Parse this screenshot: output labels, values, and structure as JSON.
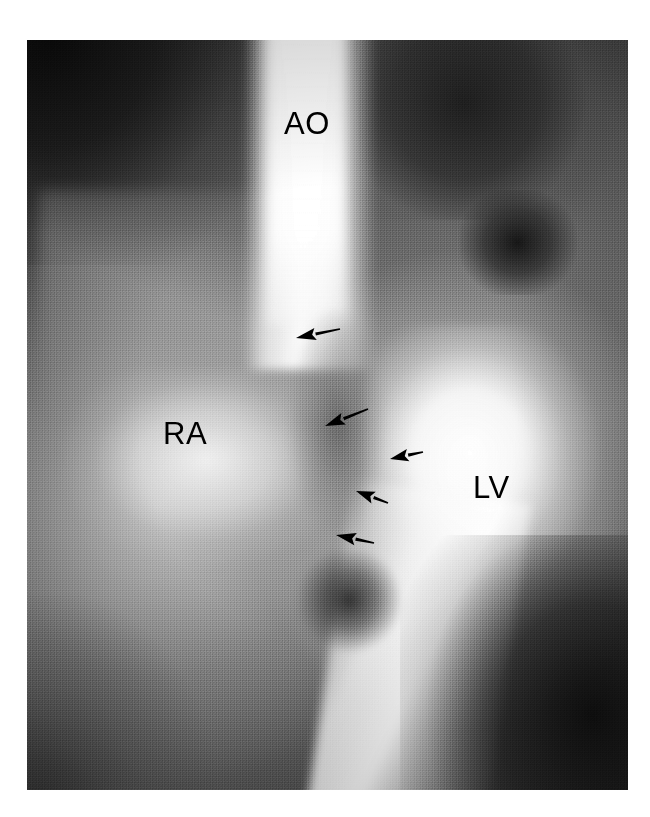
{
  "figure": {
    "kind": "medical-radiograph",
    "modality_hint": "angiocardiogram",
    "plate": {
      "x": 27,
      "y": 40,
      "width": 601,
      "height": 750,
      "background_color": "#1a1a1a",
      "page_color": "#ffffff"
    },
    "colors": {
      "page_background": "#ffffff",
      "annotation_black": "#000000",
      "contrast_white": "#ffffff",
      "plate_dark": "#1a1a1a",
      "plate_mid": "#7a7a7a"
    }
  },
  "labels": [
    {
      "id": "ao",
      "text": "AO",
      "meaning": "aorta",
      "x": 284,
      "y": 108,
      "font_size": 31
    },
    {
      "id": "ra",
      "text": "RA",
      "meaning": "right atrium",
      "x": 163,
      "y": 418,
      "font_size": 31
    },
    {
      "id": "lv",
      "text": "LV",
      "meaning": "left ventricle",
      "x": 473,
      "y": 472,
      "font_size": 31
    }
  ],
  "arrows": [
    {
      "id": "arrow-1",
      "tail_x": 340,
      "tail_y": 329,
      "tip_x": 296,
      "tip_y": 338,
      "color": "#000000"
    },
    {
      "id": "arrow-2",
      "tail_x": 368,
      "tail_y": 409,
      "tip_x": 325,
      "tip_y": 426,
      "color": "#000000"
    },
    {
      "id": "arrow-3",
      "tail_x": 423,
      "tail_y": 452,
      "tip_x": 390,
      "tip_y": 459,
      "color": "#000000"
    },
    {
      "id": "arrow-4",
      "tail_x": 388,
      "tail_y": 503,
      "tip_x": 356,
      "tip_y": 491,
      "color": "#000000"
    },
    {
      "id": "arrow-5",
      "tail_x": 374,
      "tail_y": 543,
      "tip_x": 336,
      "tip_y": 535,
      "color": "#000000"
    }
  ],
  "arrow_count": 5
}
